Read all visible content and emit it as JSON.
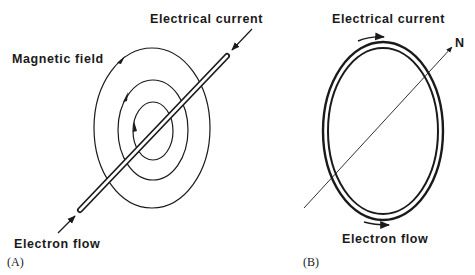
{
  "panel_a": {
    "letter": "(A)",
    "labels": {
      "current": "Electrical current",
      "field": "Magnetic field",
      "electron": "Electron flow"
    }
  },
  "panel_b": {
    "letter": "(B)",
    "labels": {
      "current": "Electrical current",
      "north": "N",
      "electron": "Electron flow"
    }
  },
  "colors": {
    "ink": "#1a1a1a",
    "background": "#ffffff"
  }
}
